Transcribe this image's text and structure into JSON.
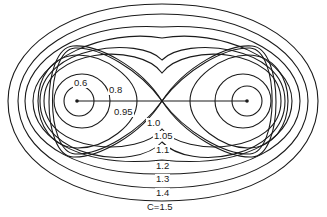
{
  "diagram": {
    "type": "contour",
    "parameter_name": "C",
    "masses": [
      {
        "name": "left-mass",
        "x": 77,
        "y": 101
      },
      {
        "name": "right-mass",
        "x": 247,
        "y": 101
      }
    ],
    "saddle_point": {
      "x": 162,
      "y": 101
    },
    "contour_labels": [
      {
        "id": "c06",
        "text": "0.6",
        "x": 73,
        "y": 78
      },
      {
        "id": "c08",
        "text": "0.8",
        "x": 108,
        "y": 85
      },
      {
        "id": "c095",
        "text": "0.95",
        "x": 113,
        "y": 107
      },
      {
        "id": "c10",
        "text": "1.0",
        "x": 146,
        "y": 118
      },
      {
        "id": "c105",
        "text": "1.05",
        "x": 153,
        "y": 131
      },
      {
        "id": "c11",
        "text": "1.1",
        "x": 155,
        "y": 145
      },
      {
        "id": "c12",
        "text": "1.2",
        "x": 155,
        "y": 161
      },
      {
        "id": "c13",
        "text": "1.3",
        "x": 155,
        "y": 174
      },
      {
        "id": "c14",
        "text": "1.4",
        "x": 155,
        "y": 188
      },
      {
        "id": "c15",
        "text": "C=1.5",
        "x": 146,
        "y": 201
      }
    ]
  }
}
